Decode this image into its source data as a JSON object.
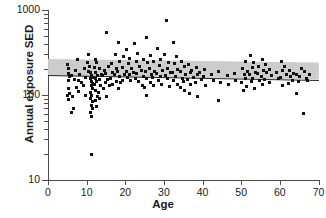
{
  "chart_data": {
    "type": "scatter",
    "title": "",
    "xlabel": "Age",
    "ylabel": "Annual exposure SED",
    "xlim": [
      0,
      70
    ],
    "ylim": [
      10,
      1000
    ],
    "yscale": "log",
    "xscale": "linear",
    "grid": false,
    "legend": null,
    "xticks": [
      0,
      10,
      20,
      30,
      40,
      50,
      60,
      70
    ],
    "xticklabels": [
      "0",
      "10",
      "20",
      "30",
      "40",
      "50",
      "60",
      "70"
    ],
    "yticks": [
      10,
      100,
      1000
    ],
    "yticklabels": [
      "10",
      "100",
      "1000"
    ],
    "yminorticks": [
      20,
      30,
      40,
      50,
      60,
      70,
      80,
      90,
      200,
      300,
      400,
      500,
      600,
      700,
      800,
      900
    ],
    "marker": "square",
    "marker_color": "#111111",
    "regression": {
      "label": "fitted regression line",
      "color": "#2b2b2b",
      "x": [
        0,
        70
      ],
      "y": [
        172,
        150
      ]
    },
    "confidence_band": {
      "label": "95% confidence band",
      "color": "#c9c9c9",
      "x": [
        0,
        70
      ],
      "y_lower": [
        172,
        150
      ],
      "y_upper": [
        268,
        243
      ]
    },
    "series": [
      {
        "name": "subjects",
        "n_points": 181,
        "points": [
          [
            5.0,
            230
          ],
          [
            5.2,
            205
          ],
          [
            5.4,
            178
          ],
          [
            5.6,
            163
          ],
          [
            5.2,
            150
          ],
          [
            5.4,
            120
          ],
          [
            5.6,
            104
          ],
          [
            5.1,
            98
          ],
          [
            5.3,
            88
          ],
          [
            6.4,
            96
          ],
          [
            6.6,
            70
          ],
          [
            6.0,
            62
          ],
          [
            6.2,
            168
          ],
          [
            6.8,
            152
          ],
          [
            7.6,
            260
          ],
          [
            7.2,
            196
          ],
          [
            7.8,
            150
          ],
          [
            7.4,
            122
          ],
          [
            8.2,
            175
          ],
          [
            8.6,
            140
          ],
          [
            8.0,
            110
          ],
          [
            9.4,
            205
          ],
          [
            9.8,
            160
          ],
          [
            9.2,
            128
          ],
          [
            9.6,
            100
          ],
          [
            10.6,
            300
          ],
          [
            10.2,
            240
          ],
          [
            10.8,
            215
          ],
          [
            10.4,
            190
          ],
          [
            11.0,
            182
          ],
          [
            11.2,
            170
          ],
          [
            11.4,
            162
          ],
          [
            11.1,
            155
          ],
          [
            11.3,
            146
          ],
          [
            11.5,
            138
          ],
          [
            11.2,
            128
          ],
          [
            11.4,
            118
          ],
          [
            11.0,
            108
          ],
          [
            11.3,
            100
          ],
          [
            11.1,
            92
          ],
          [
            11.5,
            84
          ],
          [
            11.2,
            76
          ],
          [
            11.4,
            70
          ],
          [
            11.0,
            62
          ],
          [
            11.3,
            56
          ],
          [
            11.2,
            20
          ],
          [
            12.2,
            265
          ],
          [
            12.6,
            238
          ],
          [
            12.0,
            210
          ],
          [
            12.4,
            186
          ],
          [
            12.8,
            170
          ],
          [
            12.2,
            158
          ],
          [
            12.6,
            146
          ],
          [
            12.0,
            132
          ],
          [
            12.4,
            112
          ],
          [
            12.8,
            96
          ],
          [
            12.2,
            86
          ],
          [
            12.6,
            74
          ],
          [
            13.4,
            205
          ],
          [
            13.8,
            175
          ],
          [
            13.2,
            152
          ],
          [
            13.6,
            130
          ],
          [
            13.0,
            108
          ],
          [
            13.4,
            92
          ],
          [
            14.6,
            192
          ],
          [
            14.2,
            168
          ],
          [
            14.8,
            140
          ],
          [
            14.4,
            120
          ],
          [
            15.2,
            540
          ],
          [
            15.6,
            215
          ],
          [
            15.0,
            178
          ],
          [
            15.4,
            152
          ],
          [
            15.8,
            130
          ],
          [
            15.2,
            96
          ],
          [
            16.4,
            235
          ],
          [
            16.8,
            186
          ],
          [
            16.2,
            158
          ],
          [
            16.6,
            134
          ],
          [
            17.4,
            300
          ],
          [
            17.8,
            205
          ],
          [
            17.2,
            172
          ],
          [
            17.6,
            146
          ],
          [
            18.2,
            420
          ],
          [
            18.6,
            250
          ],
          [
            18.0,
            190
          ],
          [
            18.4,
            164
          ],
          [
            18.8,
            140
          ],
          [
            18.2,
            118
          ],
          [
            19.6,
            280
          ],
          [
            19.2,
            210
          ],
          [
            19.8,
            176
          ],
          [
            19.4,
            150
          ],
          [
            20.4,
            340
          ],
          [
            20.8,
            232
          ],
          [
            20.2,
            190
          ],
          [
            20.6,
            162
          ],
          [
            21.2,
            270
          ],
          [
            21.6,
            205
          ],
          [
            21.0,
            172
          ],
          [
            21.4,
            148
          ],
          [
            22.4,
            400
          ],
          [
            22.8,
            245
          ],
          [
            22.2,
            186
          ],
          [
            22.6,
            158
          ],
          [
            23.2,
            310
          ],
          [
            23.6,
            215
          ],
          [
            23.0,
            178
          ],
          [
            23.4,
            144
          ],
          [
            24.6,
            265
          ],
          [
            24.2,
            196
          ],
          [
            24.8,
            166
          ],
          [
            24.4,
            130
          ],
          [
            25.4,
            480
          ],
          [
            25.8,
            240
          ],
          [
            25.2,
            188
          ],
          [
            25.6,
            156
          ],
          [
            25.0,
            124
          ],
          [
            25.4,
            100
          ],
          [
            26.6,
            290
          ],
          [
            26.2,
            206
          ],
          [
            26.8,
            172
          ],
          [
            26.4,
            140
          ],
          [
            27.2,
            250
          ],
          [
            27.6,
            190
          ],
          [
            27.0,
            160
          ],
          [
            27.4,
            128
          ],
          [
            28.4,
            350
          ],
          [
            28.8,
            225
          ],
          [
            28.2,
            180
          ],
          [
            28.6,
            150
          ],
          [
            29.2,
            265
          ],
          [
            29.6,
            196
          ],
          [
            29.0,
            164
          ],
          [
            29.4,
            132
          ],
          [
            30.6,
            760
          ],
          [
            30.2,
            300
          ],
          [
            30.8,
            205
          ],
          [
            30.4,
            168
          ],
          [
            31.2,
            240
          ],
          [
            31.6,
            186
          ],
          [
            31.0,
            156
          ],
          [
            31.4,
            126
          ],
          [
            32.4,
            420
          ],
          [
            32.8,
            235
          ],
          [
            32.2,
            182
          ],
          [
            32.6,
            148
          ],
          [
            33.2,
            280
          ],
          [
            33.6,
            200
          ],
          [
            33.0,
            166
          ],
          [
            33.4,
            134
          ],
          [
            34.6,
            250
          ],
          [
            34.2,
            190
          ],
          [
            34.8,
            158
          ],
          [
            34.4,
            122
          ],
          [
            35.2,
            215
          ],
          [
            35.6,
            176
          ],
          [
            35.0,
            146
          ],
          [
            35.4,
            112
          ],
          [
            36.4,
            230
          ],
          [
            36.8,
            184
          ],
          [
            36.2,
            152
          ],
          [
            36.6,
            104
          ],
          [
            37.2,
            196
          ],
          [
            37.6,
            162
          ],
          [
            37.0,
            134
          ],
          [
            38.4,
            210
          ],
          [
            38.8,
            172
          ],
          [
            38.2,
            142
          ],
          [
            38.6,
            96
          ],
          [
            39.2,
            186
          ],
          [
            39.6,
            154
          ],
          [
            40.6,
            200
          ],
          [
            40.2,
            166
          ],
          [
            40.8,
            130
          ],
          [
            42.4,
            176
          ],
          [
            42.8,
            148
          ],
          [
            44.2,
            190
          ],
          [
            44.6,
            142
          ],
          [
            44.0,
            86
          ],
          [
            46.4,
            168
          ],
          [
            46.8,
            132
          ],
          [
            48.2,
            180
          ],
          [
            48.6,
            150
          ],
          [
            50.4,
            205
          ],
          [
            50.8,
            172
          ],
          [
            50.2,
            140
          ],
          [
            50.6,
            114
          ],
          [
            51.2,
            250
          ],
          [
            51.6,
            190
          ],
          [
            51.0,
            158
          ],
          [
            51.4,
            126
          ],
          [
            52.4,
            290
          ],
          [
            52.8,
            210
          ],
          [
            52.2,
            176
          ],
          [
            52.6,
            146
          ],
          [
            53.2,
            240
          ],
          [
            53.6,
            186
          ],
          [
            53.0,
            156
          ],
          [
            53.4,
            120
          ],
          [
            54.6,
            215
          ],
          [
            54.2,
            178
          ],
          [
            54.8,
            150
          ],
          [
            55.4,
            265
          ],
          [
            55.8,
            196
          ],
          [
            55.2,
            164
          ],
          [
            55.6,
            134
          ],
          [
            56.2,
            230
          ],
          [
            56.6,
            182
          ],
          [
            56.0,
            152
          ],
          [
            57.4,
            200
          ],
          [
            57.8,
            168
          ],
          [
            57.2,
            140
          ],
          [
            59.2,
            186
          ],
          [
            59.6,
            156
          ],
          [
            60.4,
            250
          ],
          [
            60.8,
            192
          ],
          [
            60.2,
            160
          ],
          [
            60.6,
            128
          ],
          [
            61.2,
            215
          ],
          [
            61.6,
            176
          ],
          [
            62.4,
            196
          ],
          [
            62.8,
            164
          ],
          [
            62.2,
            138
          ],
          [
            63.6,
            180
          ],
          [
            63.2,
            150
          ],
          [
            64.4,
            172
          ],
          [
            64.8,
            144
          ],
          [
            64.2,
            104
          ],
          [
            65.6,
            205
          ],
          [
            65.2,
            166
          ],
          [
            66.4,
            190
          ],
          [
            66.8,
            158
          ],
          [
            66.2,
            60
          ],
          [
            67.6,
            176
          ],
          [
            67.2,
            150
          ]
        ]
      }
    ]
  }
}
